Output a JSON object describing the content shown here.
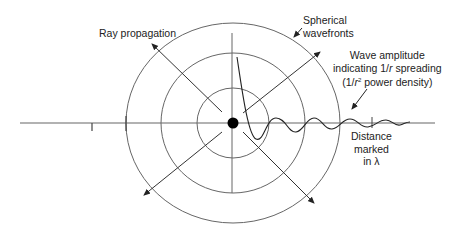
{
  "diagram": {
    "center": [
      233,
      123
    ],
    "colors": {
      "line": "#555555",
      "dark": "#222222",
      "source": "#000000",
      "background": "#ffffff"
    },
    "labels": {
      "ray_propagation": "Ray propagation",
      "spherical_wavefronts_1": "Spherical",
      "spherical_wavefronts_2": "wavefronts",
      "wave_amplitude_1": "Wave amplitude",
      "wave_amplitude_2_pre": "indicating 1/",
      "wave_amplitude_2_r": "r",
      "wave_amplitude_2_post": " spreading",
      "wave_amplitude_3_pre": "(1/",
      "wave_amplitude_3_r": "r",
      "wave_amplitude_3_sup": "2",
      "wave_amplitude_3_post": " power density)",
      "distance_1": "Distance",
      "distance_2": "marked",
      "distance_3": "in λ"
    },
    "wavefronts": [
      {
        "name": "inner",
        "rx": 36,
        "ry": 35
      },
      {
        "name": "middle",
        "rx": 72,
        "ry": 70
      },
      {
        "name": "outer",
        "rx": 107,
        "ry": 100
      }
    ],
    "rays": [
      "up-left",
      "up-right",
      "down-left",
      "down-right"
    ],
    "axis": {
      "x_start": 20,
      "x_end": 435,
      "tick_marks_x": [
        92,
        126,
        372
      ]
    },
    "icons": [
      "point-source-icon",
      "arrow-head-icon"
    ]
  }
}
